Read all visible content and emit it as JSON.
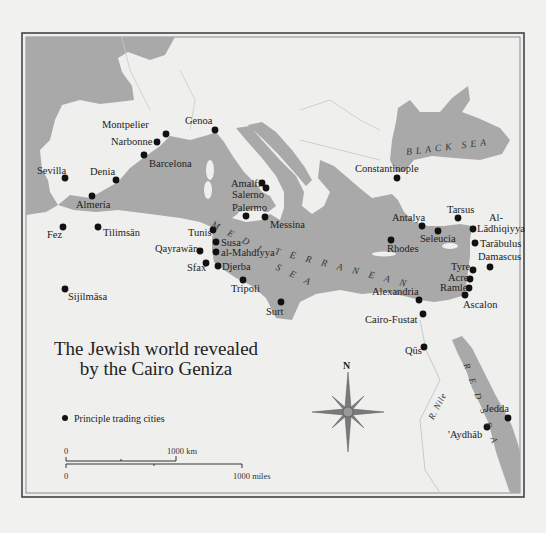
{
  "map": {
    "title_line1": "The Jewish world revealed",
    "title_line2": "by the Cairo Geniza",
    "legend": {
      "symbol": "black-dot",
      "label": "Principle trading cities"
    },
    "scale": {
      "km_zero": "0",
      "km_label": "1000 km",
      "miles_zero": "0",
      "miles_label": "1000 miles"
    },
    "compass": {
      "north_label": "N"
    },
    "colors": {
      "sea": "#a9a9a9",
      "land": "#efefee",
      "border": "#555555",
      "dot": "#111111"
    },
    "water_labels": {
      "black_sea": "BLACK SEA",
      "mediterranean_1": "M E D I",
      "mediterranean_2": "T E R R A N E A N",
      "mediterranean_sea": "S E A",
      "red_sea": "R E D  S E A",
      "nile": "R. Nile"
    },
    "cities": [
      {
        "name": "Montpelier",
        "x": 166,
        "y": 134
      },
      {
        "name": "Narbonne",
        "x": 157,
        "y": 142
      },
      {
        "name": "Barcelona",
        "x": 144,
        "y": 155
      },
      {
        "name": "Genoa",
        "x": 215,
        "y": 130
      },
      {
        "name": "Sevilla",
        "x": 65,
        "y": 178
      },
      {
        "name": "Denia",
        "x": 116,
        "y": 180
      },
      {
        "name": "Almería",
        "x": 92,
        "y": 196
      },
      {
        "name": "Amalfi",
        "x": 262,
        "y": 183
      },
      {
        "name": "Salerno",
        "x": 266,
        "y": 188
      },
      {
        "name": "Palermo",
        "x": 246,
        "y": 216
      },
      {
        "name": "Messina",
        "x": 265,
        "y": 217
      },
      {
        "name": "Fez",
        "x": 63,
        "y": 227
      },
      {
        "name": "Tilimsān",
        "x": 98,
        "y": 227
      },
      {
        "name": "Tunis",
        "x": 213,
        "y": 230
      },
      {
        "name": "Susa",
        "x": 216,
        "y": 242
      },
      {
        "name": "Qayrawān",
        "x": 200,
        "y": 251
      },
      {
        "name": "al-Mahdiyya",
        "x": 216,
        "y": 252
      },
      {
        "name": "Sfax",
        "x": 206,
        "y": 263
      },
      {
        "name": "Djerba",
        "x": 218,
        "y": 266
      },
      {
        "name": "Tripoli",
        "x": 243,
        "y": 280
      },
      {
        "name": "Sijilmāsa",
        "x": 65,
        "y": 289
      },
      {
        "name": "Surt",
        "x": 281,
        "y": 302
      },
      {
        "name": "Constantinople",
        "x": 397,
        "y": 178
      },
      {
        "name": "Antalya",
        "x": 422,
        "y": 226
      },
      {
        "name": "Tarsus",
        "x": 458,
        "y": 218
      },
      {
        "name": "Seleucia",
        "x": 438,
        "y": 231
      },
      {
        "name": "Al-Lādhiqiyya",
        "x": 473,
        "y": 229
      },
      {
        "name": "Rhodes",
        "x": 391,
        "y": 240
      },
      {
        "name": "Tarābulus",
        "x": 475,
        "y": 243
      },
      {
        "name": "Damascus",
        "x": 490,
        "y": 267
      },
      {
        "name": "Tyre",
        "x": 473,
        "y": 270
      },
      {
        "name": "Acre",
        "x": 470,
        "y": 279
      },
      {
        "name": "Ramle",
        "x": 469,
        "y": 288
      },
      {
        "name": "Ascalon",
        "x": 465,
        "y": 295
      },
      {
        "name": "Alexandria",
        "x": 419,
        "y": 300
      },
      {
        "name": "Cairo-Fustat",
        "x": 423,
        "y": 314
      },
      {
        "name": "Qūs",
        "x": 424,
        "y": 347
      },
      {
        "name": "Jedda",
        "x": 508,
        "y": 418
      },
      {
        "name": "'Aydhāb",
        "x": 487,
        "y": 427
      }
    ]
  }
}
